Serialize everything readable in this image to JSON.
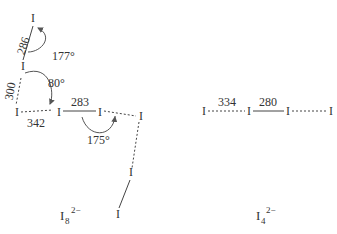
{
  "diagram": {
    "left": {
      "atom": "I",
      "bond_lengths": [
        "286",
        "300",
        "342",
        "283"
      ],
      "angles": [
        "177°",
        "80°",
        "175°"
      ],
      "label": {
        "base": "I",
        "sub": "8",
        "sup": "2−"
      }
    },
    "right": {
      "atom": "I",
      "bond_lengths": [
        "334",
        "280"
      ],
      "label": {
        "base": "I",
        "sub": "4",
        "sup": "2−"
      }
    }
  }
}
